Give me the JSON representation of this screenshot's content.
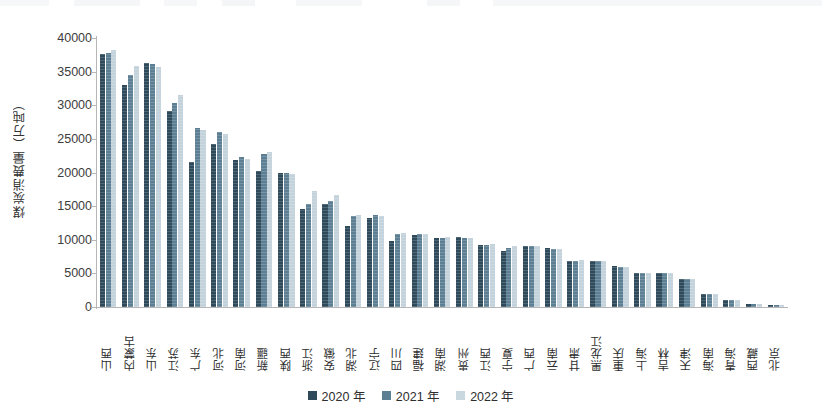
{
  "chart_data": {
    "type": "bar",
    "title": "",
    "xlabel": "",
    "ylabel": "煤炭消费量（万吨）",
    "ylim": [
      0,
      40000
    ],
    "ytick_step": 5000,
    "yticks": [
      "40000",
      "35000",
      "30000",
      "25000",
      "20000",
      "15000",
      "10000",
      "5000",
      "0"
    ],
    "grid": false,
    "legend_position": "bottom",
    "categories": [
      "山西",
      "内蒙古",
      "山东",
      "江苏",
      "广东",
      "河北",
      "河南",
      "新疆",
      "陕西",
      "浙江",
      "安徽",
      "湖北",
      "辽宁",
      "四川",
      "福建",
      "湖南",
      "贵州",
      "江西",
      "宁夏",
      "广西",
      "云南",
      "甘肃",
      "黑龙江",
      "重庆",
      "上海",
      "吉林",
      "天津",
      "海南",
      "青海",
      "西藏",
      "北京"
    ],
    "series": [
      {
        "name": "2020 年",
        "color": "#2f4a5b",
        "values": [
          37600,
          33000,
          36300,
          29200,
          21600,
          24200,
          21800,
          20200,
          20000,
          14600,
          15300,
          12000,
          13200,
          9800,
          10700,
          10300,
          10400,
          9200,
          8400,
          9000,
          8800,
          6800,
          6900,
          6100,
          5100,
          5100,
          4200,
          1900,
          1100,
          450,
          330
        ]
      },
      {
        "name": "2021 年",
        "color": "#5d7f93",
        "values": [
          37700,
          34500,
          36100,
          30400,
          26600,
          26000,
          22300,
          22800,
          20000,
          15300,
          15800,
          13600,
          13700,
          10800,
          10800,
          10300,
          10200,
          9200,
          8800,
          9100,
          8700,
          6800,
          6800,
          6000,
          5100,
          5000,
          4200,
          1900,
          1100,
          430,
          300
        ]
      },
      {
        "name": "2022 年",
        "color": "#c3d2db",
        "values": [
          38200,
          35900,
          35700,
          31600,
          26300,
          25700,
          22000,
          23100,
          19800,
          17300,
          16700,
          13700,
          13600,
          11000,
          10900,
          10400,
          10200,
          9400,
          9000,
          9100,
          8700,
          7000,
          6900,
          5900,
          5100,
          5000,
          4200,
          1900,
          1050,
          420,
          290
        ]
      }
    ]
  },
  "legend": {
    "items": [
      {
        "label": "2020 年"
      },
      {
        "label": "2021 年"
      },
      {
        "label": "2022 年"
      }
    ]
  }
}
